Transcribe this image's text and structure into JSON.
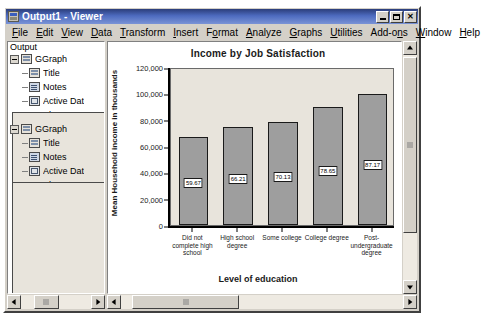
{
  "window": {
    "title": "Output1 - Viewer",
    "icon": "spss-viewer-icon",
    "buttons": {
      "minimize": "minimize-button",
      "maximize": "maximize-button",
      "close": "✕"
    }
  },
  "menubar": {
    "items": [
      {
        "label": "File",
        "accel": "F"
      },
      {
        "label": "Edit",
        "accel": "E"
      },
      {
        "label": "View",
        "accel": "V"
      },
      {
        "label": "Data",
        "accel": "D"
      },
      {
        "label": "Transform",
        "accel": "T"
      },
      {
        "label": "Insert",
        "accel": "I"
      },
      {
        "label": "Format",
        "accel": "o"
      },
      {
        "label": "Analyze",
        "accel": "A"
      },
      {
        "label": "Graphs",
        "accel": "G"
      },
      {
        "label": "Utilities",
        "accel": "U"
      },
      {
        "label": "Add-ons",
        "accel": "n"
      },
      {
        "label": "Window",
        "accel": "W"
      },
      {
        "label": "Help",
        "accel": "H"
      }
    ]
  },
  "outline": {
    "root": "Output",
    "nodes": [
      {
        "label": "GGraph",
        "level": 1,
        "toggle": "minus",
        "icon": "output-book-icon",
        "selected": false
      },
      {
        "label": "Title",
        "level": 2,
        "icon": "title-icon",
        "selected": false
      },
      {
        "label": "Notes",
        "level": 2,
        "icon": "notes-icon",
        "selected": false
      },
      {
        "label": "Active Dat",
        "level": 2,
        "icon": "active-dataset-icon",
        "selected": false
      },
      {
        "label": "Graph",
        "level": 2,
        "icon": "graph-icon",
        "selected": false
      },
      {
        "label": "GGraph",
        "level": 1,
        "toggle": "minus",
        "icon": "output-book-icon",
        "selected": false
      },
      {
        "label": "Title",
        "level": 2,
        "icon": "title-icon",
        "selected": false
      },
      {
        "label": "Notes",
        "level": 2,
        "icon": "notes-icon",
        "selected": false
      },
      {
        "label": "Active Dat",
        "level": 2,
        "icon": "active-dataset-icon",
        "selected": false
      },
      {
        "label": "Graph",
        "level": 2,
        "icon": "graph-icon",
        "selected": true
      }
    ]
  },
  "chart_data": {
    "type": "bar",
    "title": "Income by Job Satisfaction",
    "xlabel": "Level of education",
    "ylabel": "Mean Household income in thousands",
    "categories": [
      "Did not complete high school",
      "High school degree",
      "Some college",
      "College degree",
      "Post-undergraduate degree"
    ],
    "values": [
      59.67,
      66.21,
      70.13,
      78.65,
      87.17
    ],
    "data_labels": [
      "59.67",
      "66.21",
      "70.13",
      "78.65",
      "87.17"
    ],
    "ylim": [
      0,
      120000
    ],
    "yticks": [
      0,
      20000,
      40000,
      60000,
      80000,
      100000,
      120000
    ],
    "ytick_labels": [
      "0",
      "20,000",
      "40,000",
      "60,000",
      "80,000",
      "100,000",
      "120,000"
    ],
    "bar_values_plotted": [
      67000,
      74500,
      78500,
      89500,
      99500
    ],
    "grid": false,
    "legend": "none",
    "bar_color": "#9e9e9e",
    "plot_bg": "#e8e4dc",
    "outline_color": "#1a1a1a"
  },
  "scrollbars": {
    "outline_hscroll": "outline-horizontal-scrollbar",
    "viewer_hscroll": "viewer-horizontal-scrollbar",
    "viewer_vscroll": "viewer-vertical-scrollbar",
    "left_arrow": "scroll-left-arrow",
    "right_arrow": "scroll-right-arrow",
    "up_arrow": "scroll-up-arrow",
    "down_arrow": "scroll-down-arrow"
  }
}
